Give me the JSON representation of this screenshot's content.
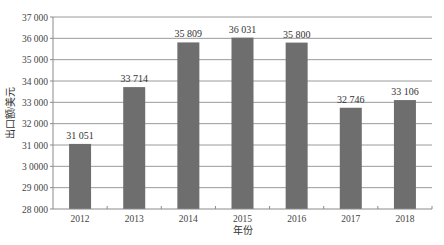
{
  "chart_data": {
    "type": "bar",
    "title": "",
    "xlabel": "年份",
    "ylabel": "出口额/美元",
    "categories": [
      "2012",
      "2013",
      "2014",
      "2015",
      "2016",
      "2017",
      "2018"
    ],
    "values": [
      31051,
      33714,
      35809,
      36031,
      35800,
      32746,
      33106
    ],
    "value_labels": [
      "31 051",
      "33 714",
      "35 809",
      "36 031",
      "35 800",
      "32 746",
      "33 106"
    ],
    "ylim": [
      28000,
      37000
    ],
    "yticks": [
      28000,
      29000,
      30000,
      31000,
      32000,
      33000,
      34000,
      35000,
      36000,
      37000
    ],
    "ytick_labels": [
      "28 000",
      "29 000",
      "3 0000",
      "31 000",
      "32 000",
      "33 000",
      "34 000",
      "35 000",
      "36 000",
      "37 000"
    ],
    "grid": true,
    "legend": null,
    "colors": {
      "bar": "#6e6e6e",
      "grid": "#9a9a9a",
      "axis": "#8a8a8a"
    }
  }
}
